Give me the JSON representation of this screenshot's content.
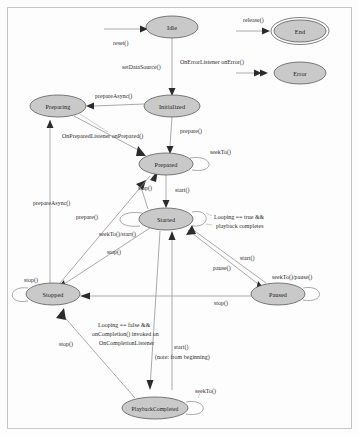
{
  "diagram": {
    "type": "state-machine",
    "canvas": {
      "width": 359,
      "height": 436
    },
    "colors": {
      "node_fill": "#c9c9c9",
      "node_stroke": "#4a4a4a",
      "edge_stroke": "#8d8d8d",
      "arrow_fill": "#2b2b2b",
      "text": "#1a1a1a",
      "frame": "#c6c6c6",
      "background": "#fdfdfd"
    },
    "states": [
      {
        "id": "idle",
        "label": "Idle",
        "cx": 172,
        "cy": 27,
        "rx": 26,
        "ry": 11,
        "final": false
      },
      {
        "id": "end",
        "label": "End",
        "cx": 300,
        "cy": 31,
        "rx": 26,
        "ry": 11,
        "final": true
      },
      {
        "id": "error",
        "label": "Error",
        "cx": 300,
        "cy": 73,
        "rx": 26,
        "ry": 11,
        "final": false
      },
      {
        "id": "initialized",
        "label": "Initialized",
        "cx": 172,
        "cy": 106,
        "rx": 28,
        "ry": 11,
        "final": false
      },
      {
        "id": "preparing",
        "label": "Preparing",
        "cx": 58,
        "cy": 106,
        "rx": 28,
        "ry": 11,
        "final": false
      },
      {
        "id": "prepared",
        "label": "Prepared",
        "cx": 166,
        "cy": 164,
        "rx": 27,
        "ry": 11,
        "final": false
      },
      {
        "id": "started",
        "label": "Started",
        "cx": 166,
        "cy": 219,
        "rx": 27,
        "ry": 11,
        "final": false
      },
      {
        "id": "stopped",
        "label": "Stopped",
        "cx": 53,
        "cy": 294,
        "rx": 27,
        "ry": 11,
        "final": false
      },
      {
        "id": "paused",
        "label": "Paused",
        "cx": 278,
        "cy": 294,
        "rx": 27,
        "ry": 11,
        "final": false
      },
      {
        "id": "playbackcompleted",
        "label": "PlaybackCompleted",
        "cx": 155,
        "cy": 408,
        "rx": 33,
        "ry": 11,
        "final": false
      }
    ],
    "transitions": [
      {
        "id": "t-reset",
        "label": "reset()",
        "from": "",
        "to": "idle",
        "label_x": 113,
        "label_y": 43
      },
      {
        "id": "t-release",
        "label": "release()",
        "from": "",
        "to": "end",
        "label_x": 243,
        "label_y": 20
      },
      {
        "id": "t-onerror",
        "label": "OnErrorListener onError()",
        "from": "",
        "to": "error",
        "label_x": 180,
        "label_y": 62
      },
      {
        "id": "t-setdatasource",
        "label": "setDataSource()",
        "from": "idle",
        "to": "initialized",
        "label_x": 122,
        "label_y": 67
      },
      {
        "id": "t-prepareasync-1",
        "label": "prepareAsync()",
        "from": "initialized",
        "to": "preparing",
        "label_x": 95,
        "label_y": 96
      },
      {
        "id": "t-prepare-1",
        "label": "prepare()",
        "from": "initialized",
        "to": "prepared",
        "label_x": 180,
        "label_y": 131
      },
      {
        "id": "t-onprepared",
        "label": "OnPreparedListener onPrepared()",
        "from": "preparing",
        "to": "prepared",
        "label_x": 62,
        "label_y": 136
      },
      {
        "id": "t-seekto-prepared",
        "label": "seekTo()",
        "from": "prepared",
        "to": "prepared",
        "label_x": 210,
        "label_y": 152
      },
      {
        "id": "t-start-1",
        "label": "start()",
        "from": "prepared",
        "to": "started",
        "label_x": 175,
        "label_y": 190
      },
      {
        "id": "t-stop-1",
        "label": "stop()",
        "from": "started",
        "to": "prepared",
        "label_x": 138,
        "label_y": 188
      },
      {
        "id": "t-seekto-start",
        "label": "seekTo()/start()",
        "from": "started",
        "to": "started",
        "label_x": 99,
        "label_y": 234
      },
      {
        "id": "t-looping-true",
        "label": "Looping == true &&",
        "from": "started",
        "to": "started",
        "label_x": 214,
        "label_y": 217
      },
      {
        "id": "t-looping-true-2",
        "label": "playback completes",
        "from": "started",
        "to": "started",
        "label_x": 216,
        "label_y": 226
      },
      {
        "id": "t-prepare-2",
        "label": "prepare()",
        "from": "stopped",
        "to": "prepared",
        "label_x": 76,
        "label_y": 217
      },
      {
        "id": "t-prepareasync-2",
        "label": "prepareAsync()",
        "from": "stopped",
        "to": "preparing",
        "label_x": 33,
        "label_y": 203
      },
      {
        "id": "t-stop-2",
        "label": "stop()",
        "from": "started",
        "to": "stopped",
        "label_x": 107,
        "label_y": 252
      },
      {
        "id": "t-pause",
        "label": "pause()",
        "from": "started",
        "to": "paused",
        "label_x": 213,
        "label_y": 268
      },
      {
        "id": "t-start-2",
        "label": "start()",
        "from": "paused",
        "to": "started",
        "label_x": 240,
        "label_y": 258
      },
      {
        "id": "t-seekto-pause",
        "label": "seekTo()/pause()",
        "from": "paused",
        "to": "paused",
        "label_x": 272,
        "label_y": 277
      },
      {
        "id": "t-stop-3",
        "label": "stop()",
        "from": "paused",
        "to": "stopped",
        "label_x": 214,
        "label_y": 303
      },
      {
        "id": "t-stop-4",
        "label": "stop()",
        "from": "playbackcompleted",
        "to": "stopped",
        "label_x": 59,
        "label_y": 344
      },
      {
        "id": "t-looping-false-1",
        "label": "Looping == false &&",
        "from": "started",
        "to": "playbackcompleted",
        "label_x": 98,
        "label_y": 325
      },
      {
        "id": "t-looping-false-2",
        "label": "onCompletion() invoked on",
        "from": "started",
        "to": "playbackcompleted",
        "label_x": 92,
        "label_y": 334
      },
      {
        "id": "t-looping-false-3",
        "label": "OnCompletionListener",
        "from": "started",
        "to": "playbackcompleted",
        "label_x": 99,
        "label_y": 343
      },
      {
        "id": "t-start-3",
        "label": "start()",
        "from": "playbackcompleted",
        "to": "started",
        "label_x": 174,
        "label_y": 347
      },
      {
        "id": "t-start-3-note",
        "label": "(note: from beginning)",
        "from": "playbackcompleted",
        "to": "started",
        "label_x": 155,
        "label_y": 357
      },
      {
        "id": "t-seekto-pbc",
        "label": "seekTo()",
        "from": "playbackcompleted",
        "to": "playbackcompleted",
        "label_x": 195,
        "label_y": 391
      }
    ]
  }
}
